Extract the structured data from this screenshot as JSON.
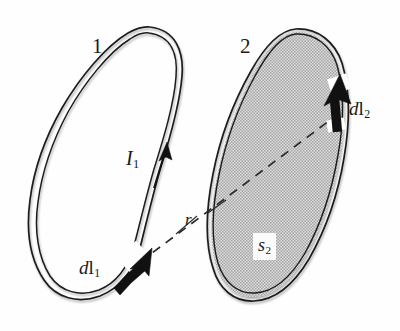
{
  "figure": {
    "width": 400,
    "height": 331,
    "background_color": "#fefefe",
    "ink_color": "#1a1a1a"
  },
  "labels": {
    "loop_1": "1",
    "loop_2": "2",
    "current_1_symbol": "I",
    "current_1_subscript": "1",
    "dl_1_d": "d",
    "dl_1_l": "l",
    "dl_1_subscript": "1",
    "dl_2_d": "d",
    "dl_2_l": "l",
    "dl_2_subscript": "2",
    "distance_r": "r",
    "surface_2_symbol": "s",
    "surface_2_subscript": "2"
  },
  "elements": {
    "loop_1_name": "current loop 1 (unfilled double-line contour)",
    "loop_2_name": "current loop 2 (stippled shaded surface)",
    "current_arrow_1": "arrow indicating direction of current I1",
    "dl_arrow_1": "bold arrow for line element dl1 on loop 1",
    "dl_arrow_2": "bold arrow for line element dl2 on loop 2",
    "separation_line": "dashed line of length r between dl1 and dl2"
  },
  "style": {
    "contour_stroke": "#1c1c1c",
    "contour_width_px": 1.6,
    "stipple_fill": "#cfcfcf",
    "stipple_dot": "#8f8f8f",
    "arrow_fill": "#111111",
    "dashed_stroke": "#2a2a2a",
    "dash_pattern": "9 7"
  }
}
